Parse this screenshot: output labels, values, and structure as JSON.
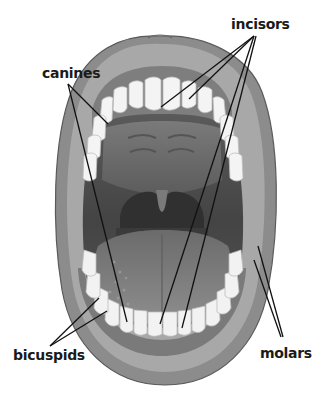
{
  "diagram": {
    "labels": [
      {
        "id": "incisors",
        "text": "incisors",
        "x": 231,
        "y": 17
      },
      {
        "id": "canines",
        "text": "canines",
        "x": 42,
        "y": 66
      },
      {
        "id": "bicuspids",
        "text": "bicuspids",
        "x": 13,
        "y": 348
      },
      {
        "id": "molars",
        "text": "molars",
        "x": 260,
        "y": 346
      }
    ],
    "leader_lines": [
      {
        "label": "incisors",
        "from": [
          254,
          36
        ],
        "to": [
          161,
          107
        ]
      },
      {
        "label": "incisors",
        "from": [
          254,
          36
        ],
        "to": [
          189,
          99
        ]
      },
      {
        "label": "incisors",
        "from": [
          254,
          36
        ],
        "to": [
          160,
          324
        ]
      },
      {
        "label": "incisors",
        "from": [
          256,
          36
        ],
        "to": [
          182,
          328
        ]
      },
      {
        "label": "canines",
        "from": [
          68,
          84
        ],
        "to": [
          108,
          124
        ]
      },
      {
        "label": "canines",
        "from": [
          68,
          84
        ],
        "to": [
          127,
          322
        ]
      },
      {
        "label": "bicuspids",
        "from": [
          50,
          346
        ],
        "to": [
          99,
          298
        ]
      },
      {
        "label": "bicuspids",
        "from": [
          50,
          346
        ],
        "to": [
          107,
          311
        ]
      },
      {
        "label": "molars",
        "from": [
          283,
          337
        ],
        "to": [
          258,
          246
        ]
      },
      {
        "label": "molars",
        "from": [
          281,
          337
        ],
        "to": [
          254,
          260
        ]
      }
    ],
    "colors": {
      "background": "#ffffff",
      "lip": "#8a8a8a",
      "lip_dark": "#5e5e5e",
      "gum": "#9a9a9a",
      "mouth_cavity": "#4a4a4a",
      "palate": "#6e6e6e",
      "throat": "#2e2e2e",
      "tongue": "#7d7d7d",
      "teeth": "#f4f4f4",
      "tooth_shadow": "#c8c8c8",
      "line": "#111111",
      "text": "#1a1a1a"
    }
  }
}
